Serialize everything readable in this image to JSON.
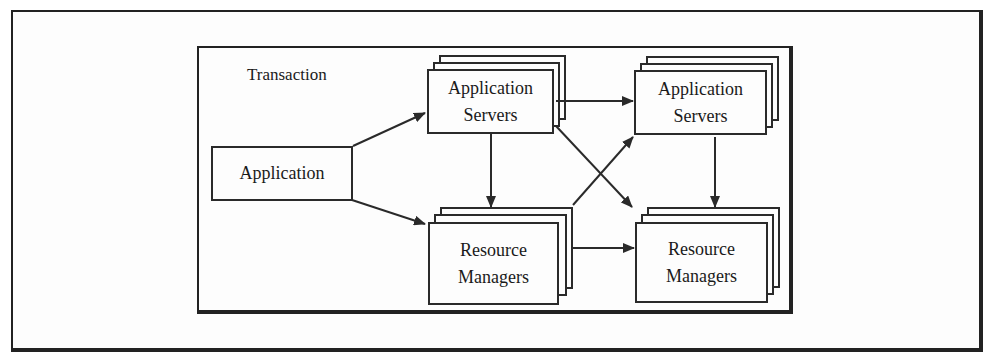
{
  "diagram": {
    "container_label": "Transaction",
    "nodes": {
      "application": {
        "label": "Application"
      },
      "app_servers_1": {
        "line1": "Application",
        "line2": "Servers"
      },
      "app_servers_2": {
        "line1": "Application",
        "line2": "Servers"
      },
      "resource_managers_1": {
        "line1": "Resource",
        "line2": "Managers"
      },
      "resource_managers_2": {
        "line1": "Resource",
        "line2": "Managers"
      }
    },
    "edges": [
      {
        "from": "Application",
        "to": "Application Servers (1)"
      },
      {
        "from": "Application",
        "to": "Resource Managers (1)"
      },
      {
        "from": "Application Servers (1)",
        "to": "Application Servers (2)"
      },
      {
        "from": "Application Servers (1)",
        "to": "Resource Managers (1)"
      },
      {
        "from": "Application Servers (1)",
        "to": "Resource Managers (2)"
      },
      {
        "from": "Resource Managers (1)",
        "to": "Application Servers (2)"
      },
      {
        "from": "Resource Managers (1)",
        "to": "Resource Managers (2)"
      },
      {
        "from": "Application Servers (2)",
        "to": "Resource Managers (2)"
      }
    ],
    "colors": {
      "stroke": "#2a2a2a",
      "background": "#fdfdfd"
    }
  }
}
